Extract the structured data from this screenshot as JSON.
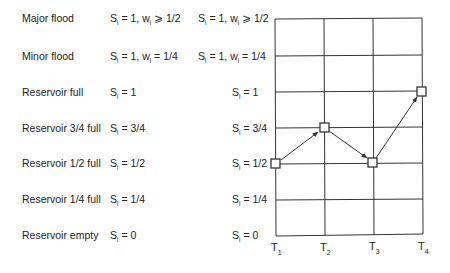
{
  "diagram": {
    "type": "state-transition-grid",
    "states": [
      {
        "label": "Major flood",
        "condition": {
          "s": "1",
          "w_rel": "⩾",
          "w": "1/2"
        },
        "axis_label": {
          "s": "1",
          "w_rel": "⩾",
          "w": "1/2"
        }
      },
      {
        "label": "Minor flood",
        "condition": {
          "s": "1",
          "w_rel": "=",
          "w": "1/4"
        },
        "axis_label": {
          "s": "1",
          "w_rel": "=",
          "w": "1/4"
        }
      },
      {
        "label": "Reservoir full",
        "condition": {
          "s": "1"
        },
        "axis_label": {
          "s": "1"
        }
      },
      {
        "label": "Reservoir 3/4 full",
        "condition": {
          "s": "3/4"
        },
        "axis_label": {
          "s": "3/4"
        }
      },
      {
        "label": "Reservoir 1/2 full",
        "condition": {
          "s": "1/2"
        },
        "axis_label": {
          "s": "1/2"
        }
      },
      {
        "label": "Reservoir 1/4 full",
        "condition": {
          "s": "1/4"
        },
        "axis_label": {
          "s": "1/4"
        }
      },
      {
        "label": "Reservoir empty",
        "condition": {
          "s": "0"
        },
        "axis_label": {
          "s": "0"
        }
      }
    ],
    "time_axis": [
      {
        "t": "T",
        "sub": "1"
      },
      {
        "t": "T",
        "sub": "2"
      },
      {
        "t": "T",
        "sub": "3"
      },
      {
        "t": "T",
        "sub": "4"
      }
    ],
    "path": [
      {
        "time": "T1",
        "state": "Reservoir 1/2 full"
      },
      {
        "time": "T2",
        "state": "Reservoir 3/4 full"
      },
      {
        "time": "T3",
        "state": "Reservoir 1/2 full"
      },
      {
        "time": "T4",
        "state": "Reservoir full"
      }
    ],
    "symbols": {
      "S": "S",
      "w": "w",
      "i": "i",
      "eq": " = ",
      "comma": ", "
    },
    "colors": {
      "line": "#333333",
      "text": "#222222",
      "background": "#ffffff"
    }
  }
}
